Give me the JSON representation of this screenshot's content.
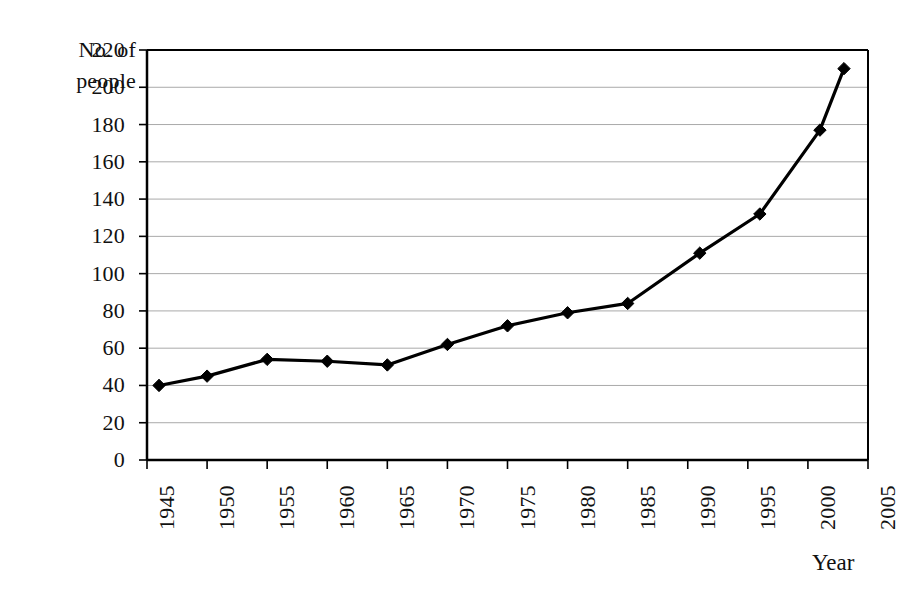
{
  "chart_data": {
    "type": "line",
    "title": "",
    "subtitle": "",
    "xlabel": "Year",
    "ylabel": "No. of people",
    "ylabel_lines": [
      "No. of",
      "people"
    ],
    "xlim": [
      1945,
      2005
    ],
    "ylim": [
      0,
      220
    ],
    "grid": true,
    "grid_axis": "y",
    "legend": false,
    "legend_position": "none",
    "marker": "diamond",
    "line_color": "#000000",
    "marker_color": "#000000",
    "grid_color": "#aaaaaa",
    "axis_color": "#000000",
    "background": "#ffffff",
    "x": [
      1946,
      1950,
      1955,
      1960,
      1965,
      1970,
      1975,
      1980,
      1985,
      1991,
      1996,
      2001,
      2003
    ],
    "values": [
      40,
      45,
      54,
      53,
      51,
      62,
      72,
      79,
      84,
      111,
      132,
      177,
      210
    ],
    "series": [
      {
        "name": "No. of people",
        "x": [
          1946,
          1950,
          1955,
          1960,
          1965,
          1970,
          1975,
          1980,
          1985,
          1991,
          1996,
          2001,
          2003
        ],
        "values": [
          40,
          45,
          54,
          53,
          51,
          62,
          72,
          79,
          84,
          111,
          132,
          177,
          210
        ]
      }
    ],
    "ytick_labels": [
      "220",
      "200",
      "180",
      "160",
      "140",
      "120",
      "100",
      "80",
      "60",
      "40",
      "20",
      "0"
    ],
    "ytick_values": [
      220,
      200,
      180,
      160,
      140,
      120,
      100,
      80,
      60,
      40,
      20,
      0
    ],
    "xtick_labels": [
      "1945",
      "1950",
      "1955",
      "1960",
      "1965",
      "1970",
      "1975",
      "1980",
      "1985",
      "1990",
      "1995",
      "2000",
      "2005"
    ],
    "xtick_values": [
      1945,
      1950,
      1955,
      1960,
      1965,
      1970,
      1975,
      1980,
      1985,
      1990,
      1995,
      2000,
      2005
    ]
  }
}
